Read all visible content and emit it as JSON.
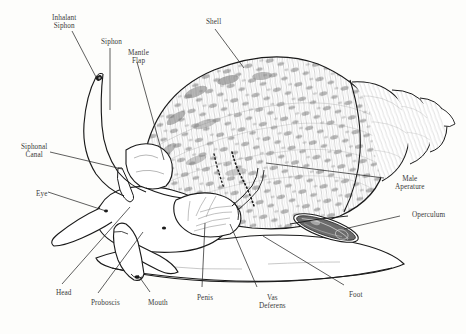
{
  "figure": {
    "background_color": "#fdfdfb",
    "ink_color": "#1a1a1a",
    "label_color": "#3a3a3a",
    "width": 466,
    "height": 334
  },
  "labels": [
    {
      "id": "inhalant-siphon",
      "text": "Inhalant\nSiphon",
      "x": 52,
      "y": 14,
      "align": "ctr"
    },
    {
      "id": "siphon",
      "text": "Siphon",
      "x": 101,
      "y": 38,
      "align": "ctr"
    },
    {
      "id": "mantle-flap",
      "text": "Mantle\nFlap",
      "x": 128,
      "y": 49,
      "align": "ctr"
    },
    {
      "id": "shell",
      "text": "Shell",
      "x": 206,
      "y": 18,
      "align": "ctr"
    },
    {
      "id": "siphonal-canal",
      "text": "Siphonal\nCanal",
      "x": 21,
      "y": 143,
      "align": "ctr"
    },
    {
      "id": "eye",
      "text": "Eye",
      "x": 36,
      "y": 190,
      "align": "ctr"
    },
    {
      "id": "male-aperature",
      "text": "Male\nAperature",
      "x": 395,
      "y": 175,
      "align": "ctr"
    },
    {
      "id": "operculum",
      "text": "Operculum",
      "x": 412,
      "y": 211,
      "align": "ctr"
    },
    {
      "id": "head",
      "text": "Head",
      "x": 56,
      "y": 289,
      "align": "ctr"
    },
    {
      "id": "proboscis",
      "text": "Proboscis",
      "x": 91,
      "y": 299,
      "align": "ctr"
    },
    {
      "id": "mouth",
      "text": "Mouth",
      "x": 148,
      "y": 299,
      "align": "ctr"
    },
    {
      "id": "penis",
      "text": "Penis",
      "x": 197,
      "y": 294,
      "align": "ctr"
    },
    {
      "id": "vas-deferens",
      "text": "Vas\nDeferens",
      "x": 259,
      "y": 294,
      "align": "ctr"
    },
    {
      "id": "foot",
      "text": "Foot",
      "x": 349,
      "y": 291,
      "align": "ctr"
    }
  ],
  "leader_lines": [
    {
      "id": "leader-inhalant-siphon",
      "from": [
        72,
        31
      ],
      "to": [
        96,
        77
      ]
    },
    {
      "id": "leader-siphon",
      "from": [
        110,
        48
      ],
      "to": [
        110,
        110
      ]
    },
    {
      "id": "leader-mantle-flap",
      "from": [
        137,
        62
      ],
      "to": [
        164,
        160
      ]
    },
    {
      "id": "leader-shell",
      "from": [
        215,
        29
      ],
      "to": [
        244,
        68
      ]
    },
    {
      "id": "leader-siphonal-canal",
      "from": [
        50,
        152
      ],
      "to": [
        122,
        169
      ]
    },
    {
      "id": "leader-eye",
      "from": [
        48,
        192
      ],
      "to": [
        106,
        211
      ]
    },
    {
      "id": "leader-male-aperature",
      "from": [
        384,
        178
      ],
      "to": [
        266,
        163
      ]
    },
    {
      "id": "leader-operculum",
      "from": [
        400,
        216
      ],
      "to": [
        344,
        229
      ]
    },
    {
      "id": "leader-head",
      "from": [
        62,
        284
      ],
      "to": [
        130,
        207
      ]
    },
    {
      "id": "leader-proboscis",
      "from": [
        98,
        293
      ],
      "to": [
        143,
        232
      ]
    },
    {
      "id": "leader-mouth",
      "from": [
        150,
        292
      ],
      "to": [
        138,
        275
      ]
    },
    {
      "id": "leader-penis",
      "from": [
        202,
        287
      ],
      "to": [
        205,
        223
      ]
    },
    {
      "id": "leader-vas-deferens",
      "from": [
        257,
        287
      ],
      "to": [
        230,
        224
      ]
    },
    {
      "id": "leader-foot",
      "from": [
        344,
        285
      ],
      "to": [
        263,
        236
      ]
    }
  ]
}
